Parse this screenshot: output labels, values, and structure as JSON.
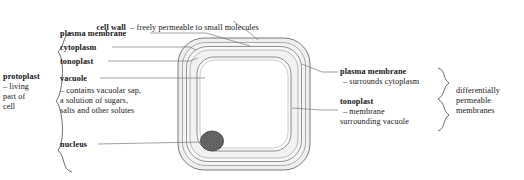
{
  "diagram": {
    "colors": {
      "ink": "#161616",
      "line": "#6d6d6d",
      "cell_wall_fill": "#eeeeee",
      "cytoplasm_fill": "#f2f2f2",
      "vacuole_fill": "#ffffff",
      "nucleus_fill": "#555555",
      "background": "#ffffff"
    }
  },
  "top_label": {
    "term": "cell wall",
    "dash": "–",
    "description": "freely permeable to small molecules",
    "full": "cell wall  –  freely permeable to small molecules"
  },
  "left_labels": [
    {
      "term": "plasma membrane",
      "detail": ""
    },
    {
      "term": "cytoplasm",
      "detail": ""
    },
    {
      "term": "tonoplast",
      "detail": ""
    },
    {
      "term": "vacuole",
      "detail_lines": [
        "– contains vacuolar sap,",
        "a solution of sugars,",
        "salts and other solutes"
      ]
    },
    {
      "term": "nucleus",
      "detail": ""
    }
  ],
  "left_group": {
    "term": "protoplast",
    "detail_lines": [
      "– living",
      "part of",
      "cell"
    ],
    "brace": "left-curly-brace"
  },
  "right_labels": [
    {
      "term": "plasma membrane",
      "detail_lines": [
        "– surrounds cytoplasm"
      ]
    },
    {
      "term": "tonoplast",
      "detail_lines": [
        "– membrane",
        "surrounding vacuole"
      ]
    }
  ],
  "right_group": {
    "detail_lines": [
      "differentially",
      "permeable",
      "membranes"
    ],
    "brace": "right-curly-brace"
  },
  "cell_parts": [
    "cell-wall",
    "plasma-membrane",
    "cytoplasm",
    "tonoplast",
    "vacuole",
    "nucleus"
  ]
}
